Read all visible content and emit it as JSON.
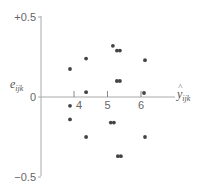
{
  "chart_data": {
    "type": "scatter",
    "title": "",
    "xlabel": "ŷ_ijk",
    "ylabel": "e_ijk",
    "xlabel_main": "y",
    "xlabel_hat": "^",
    "xlabel_sub": "ijk",
    "ylabel_main": "e",
    "ylabel_sub": "ijk",
    "xlim": [
      2.98,
      7.0
    ],
    "ylim": [
      -0.5,
      0.5
    ],
    "x_ticks": [
      4,
      5,
      6
    ],
    "x_tick_labels": [
      "4",
      "5",
      "6"
    ],
    "y_ticks": [
      0.5,
      0,
      -0.5
    ],
    "y_tick_labels": [
      "+0.5",
      "0",
      "−0.5"
    ],
    "grid": false,
    "legend": null,
    "point_color": "#444444",
    "axis_color": "#aaaaaa",
    "points": [
      {
        "x": 3.88,
        "y": 0.175
      },
      {
        "x": 4.36,
        "y": 0.24
      },
      {
        "x": 4.36,
        "y": 0.03
      },
      {
        "x": 3.88,
        "y": -0.055
      },
      {
        "x": 3.88,
        "y": -0.14
      },
      {
        "x": 4.36,
        "y": -0.25
      },
      {
        "x": 5.16,
        "y": 0.32
      },
      {
        "x": 5.28,
        "y": 0.29
      },
      {
        "x": 5.37,
        "y": 0.29
      },
      {
        "x": 6.12,
        "y": 0.23
      },
      {
        "x": 5.28,
        "y": 0.1
      },
      {
        "x": 5.37,
        "y": 0.1
      },
      {
        "x": 6.09,
        "y": 0.025
      },
      {
        "x": 5.1,
        "y": -0.16
      },
      {
        "x": 5.19,
        "y": -0.16
      },
      {
        "x": 6.12,
        "y": -0.25
      },
      {
        "x": 5.31,
        "y": -0.37
      },
      {
        "x": 5.4,
        "y": -0.37
      }
    ]
  }
}
